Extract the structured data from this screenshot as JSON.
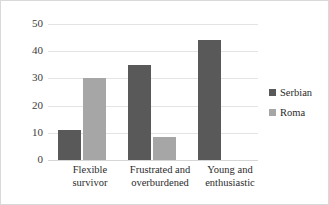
{
  "chart_data": {
    "type": "bar",
    "title": "",
    "subtitle": "",
    "xlabel": "",
    "ylabel": "",
    "categories": [
      "Flexible survivor",
      "Frustrated and overburdened",
      "Young and enthusiastic"
    ],
    "category_lines": [
      [
        "Flexible",
        "survivor"
      ],
      [
        "Frustrated and",
        "overburdened"
      ],
      [
        "Young and",
        "enthusiastic"
      ]
    ],
    "series": [
      {
        "name": "Serbian",
        "color": "#595959",
        "values": [
          11,
          35,
          44
        ]
      },
      {
        "name": "Roma",
        "color": "#a6a6a6",
        "values": [
          30,
          8.5,
          null
        ]
      }
    ],
    "ylim": [
      0,
      50
    ],
    "yticks": [
      0,
      10,
      20,
      30,
      40,
      50
    ],
    "ytick_labels": [
      "0",
      "10",
      "20",
      "30",
      "40",
      "50"
    ],
    "grid": true,
    "grid_color": "#e4e4e4",
    "legend_position": "right",
    "legend": [
      {
        "label": "Serbian",
        "color": "#595959"
      },
      {
        "label": "Roma",
        "color": "#a6a6a6"
      }
    ],
    "background_color": "#ffffff",
    "border_color": "#d9d9d9"
  }
}
